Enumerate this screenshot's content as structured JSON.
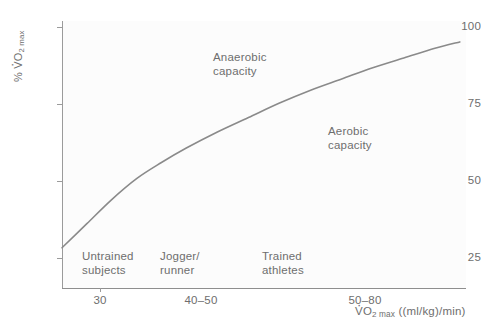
{
  "chart_data": {
    "type": "line",
    "title": "",
    "xlabel": "VO2 max ((ml/kg)/min)",
    "ylabel": "% VO2 max",
    "xlabel_parts": {
      "v": "V",
      "o": "O",
      "two": "2",
      "max": "max",
      "units": "((ml/kg)/min)"
    },
    "ylabel_parts": {
      "pct": "%",
      "v": "V",
      "o": "O",
      "two": "2",
      "max": "max"
    },
    "grid": false,
    "legend": "none",
    "ylim": [
      20,
      103
    ],
    "yticks": [
      25,
      50,
      75,
      100
    ],
    "ytick_labels": [
      "25",
      "50",
      "75",
      "100"
    ],
    "xticks": [
      30,
      45,
      65
    ],
    "xtick_labels": [
      "30",
      "40–50",
      "50–80"
    ],
    "xlim": [
      20,
      85
    ],
    "series": [
      {
        "name": "% VO2 max vs VO2 max",
        "color": "#8a8a8a",
        "points": [
          {
            "x": 20.0,
            "y": 32.5
          },
          {
            "x": 24.0,
            "y": 40.0
          },
          {
            "x": 28.0,
            "y": 47.5
          },
          {
            "x": 32.0,
            "y": 54.0
          },
          {
            "x": 36.0,
            "y": 59.0
          },
          {
            "x": 40.0,
            "y": 63.5
          },
          {
            "x": 45.0,
            "y": 68.5
          },
          {
            "x": 50.0,
            "y": 73.0
          },
          {
            "x": 55.0,
            "y": 77.5
          },
          {
            "x": 60.0,
            "y": 81.5
          },
          {
            "x": 65.0,
            "y": 85.0
          },
          {
            "x": 70.0,
            "y": 88.5
          },
          {
            "x": 75.0,
            "y": 91.5
          },
          {
            "x": 80.0,
            "y": 94.5
          },
          {
            "x": 84.0,
            "y": 96.5
          }
        ]
      }
    ],
    "annotations": [
      {
        "name": "anaerobic-capacity",
        "text": "Anaerobic\ncapacity",
        "x": 47,
        "y": 90
      },
      {
        "name": "aerobic-capacity",
        "text": "Aerobic\ncapacity",
        "x": 67,
        "y": 73
      }
    ],
    "categories": [
      {
        "name": "untrained-subjects",
        "text": "Untrained\nsubjects",
        "x": 28
      },
      {
        "name": "jogger-runner",
        "text": "Jogger/\nrunner",
        "x": 43
      },
      {
        "name": "trained-athletes",
        "text": "Trained\nathletes",
        "x": 59
      }
    ],
    "colors": {
      "curve": "#8a8a8a",
      "axis": "#9b9b9b",
      "text": "#6e6e6e",
      "plot_background": "#fcfcfc",
      "page_background": "#ffffff"
    }
  },
  "axis": {
    "y_ticks": [
      {
        "label": "100",
        "top": 27
      },
      {
        "label": "75",
        "top": 104
      },
      {
        "label": "50",
        "top": 181
      },
      {
        "label": "25",
        "top": 258
      }
    ],
    "x_ticks": [
      {
        "label": "30",
        "left": 100
      },
      {
        "label": "40–50",
        "left": 201
      },
      {
        "label": "50–80",
        "left": 365
      }
    ]
  },
  "annotations": [
    {
      "text": "Anaerobic\ncapacity",
      "left": 213,
      "top": 50
    },
    {
      "text": "Aerobic\ncapacity",
      "left": 328,
      "top": 124
    }
  ],
  "categories": [
    {
      "text": "Untrained\nsubjects",
      "left": 82,
      "top": 249
    },
    {
      "text": "Jogger/\nrunner",
      "left": 160,
      "top": 249
    },
    {
      "text": "Trained\nathletes",
      "left": 262,
      "top": 249
    }
  ]
}
